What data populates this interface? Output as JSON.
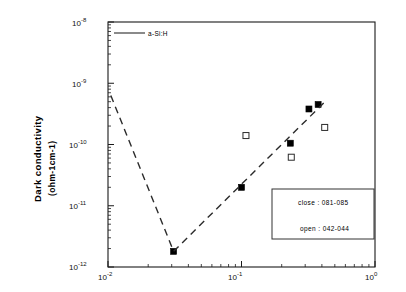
{
  "chart_data": {
    "type": "scatter",
    "title": "",
    "xlabel": "",
    "ylabel": "Dark conductivity (ohm-1cm-1)",
    "ylabel_line1": "Dark conductivity",
    "ylabel_line2": "(ohm-1cm-1)",
    "xscale": "log",
    "yscale": "log",
    "xlim": [
      0.01,
      1.0
    ],
    "ylim": [
      1e-12,
      1e-08
    ],
    "grid": false,
    "xticks": [
      0.01,
      0.1,
      1.0
    ],
    "xtick_labels": [
      "10-2",
      "10-1",
      "100"
    ],
    "xtick_mantissa": [
      "10",
      "10",
      "10"
    ],
    "xtick_exponents": [
      "-2",
      "-1",
      "0"
    ],
    "yticks": [
      1e-08,
      1e-09,
      1e-10,
      1e-11,
      1e-12
    ],
    "ytick_mantissa": [
      "10",
      "10",
      "10",
      "10",
      "10"
    ],
    "ytick_exponents": [
      "-8",
      "-9",
      "-10",
      "-11",
      "-12"
    ],
    "series": [
      {
        "name": "closed squares",
        "marker": "filled-square",
        "legend_note": "close : 081-085",
        "points": [
          {
            "x": 0.031,
            "y": 1.8e-12
          },
          {
            "x": 0.1,
            "y": 2e-11
          },
          {
            "x": 0.232,
            "y": 1.05e-10
          },
          {
            "x": 0.32,
            "y": 3.8e-10
          },
          {
            "x": 0.375,
            "y": 4.5e-10
          }
        ]
      },
      {
        "name": "open squares",
        "marker": "open-square",
        "legend_note": "open : 042-044",
        "points": [
          {
            "x": 0.108,
            "y": 1.4e-10
          },
          {
            "x": 0.236,
            "y": 6.2e-11
          },
          {
            "x": 0.42,
            "y": 1.9e-10
          }
        ]
      },
      {
        "name": "a-Si:H trend",
        "marker": "dashed-line",
        "linestyle": "dashed",
        "points": [
          {
            "x": 0.0105,
            "y": 6.3e-10
          },
          {
            "x": 0.031,
            "y": 1.8e-12
          },
          {
            "x": 0.43,
            "y": 5.2e-10
          }
        ]
      }
    ],
    "annotations": [
      {
        "id": "legend-key",
        "text": "a-Si:H",
        "marker": "solid-line"
      },
      {
        "id": "legend-box-line-1",
        "text": "close : 081-085"
      },
      {
        "id": "legend-box-line-2",
        "text": "open : 042-044"
      }
    ],
    "colors": {
      "axis": "#1a1a1a",
      "marker_filled": "#000000",
      "marker_open_edge": "#2b2b2b",
      "dashed_line": "#2b2b2b",
      "background": "#ffffff"
    }
  },
  "legend_key": {
    "label": "a-Si:H"
  },
  "legend_box": {
    "line1": "close : 081-085",
    "line2": "open : 042-044"
  },
  "axis_labels": {
    "y_line1": "Dark conductivity",
    "y_line2": "(ohm-1cm-1)"
  }
}
